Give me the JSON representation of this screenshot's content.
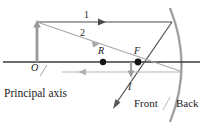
{
  "figure": {
    "type": "concave-mirror-ray-diagram",
    "title": "",
    "width": 208,
    "height": 130,
    "colors": {
      "dark_line": "#3a3a3a",
      "gray_line": "#a8a8a8",
      "mid_gray": "#8c8c8c",
      "object_gray": "#9a9a9a",
      "mirror_gray": "#b0b0b0",
      "text": "#1b1b1b"
    },
    "labels": {
      "ray_one": "1",
      "ray_two": "2",
      "vertex_origin": "O",
      "center_of_curvature": "R",
      "focal_point": "F",
      "image": "I",
      "principal_axis": "Principal axis",
      "front": "Front",
      "back": "Back"
    },
    "geometry": {
      "axis_y": 62,
      "axis_x_start": 3,
      "axis_x_end": 200,
      "object_x": 37,
      "object_tip_y": 22,
      "ray1_y": 22,
      "mirror_hit_top": [
        172,
        22
      ],
      "point_R": [
        103,
        62
      ],
      "point_F": [
        138,
        62
      ],
      "image_arrow_x": 131,
      "image_arrow_bottom_y": 76,
      "mirror_vertex": [
        186,
        62
      ]
    }
  }
}
